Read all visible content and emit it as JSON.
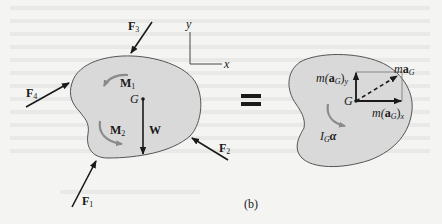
{
  "figure": {
    "caption": "(b)",
    "equals_sign": "=",
    "colors": {
      "background": "#f4f4f2",
      "body_fill": "#d9d9d9",
      "body_outline": "#555555",
      "vector": "#1a1a1a",
      "moment_arrow": "#8a8a8a"
    },
    "axes": {
      "y_label": "y",
      "x_label": "x"
    },
    "free_body_diagram": {
      "forces": [
        {
          "id": "F1",
          "label": "F",
          "sub": "1"
        },
        {
          "id": "F2",
          "label": "F",
          "sub": "2"
        },
        {
          "id": "F3",
          "label": "F",
          "sub": "3"
        },
        {
          "id": "F4",
          "label": "F",
          "sub": "4"
        }
      ],
      "moments": [
        {
          "id": "M1",
          "label": "M",
          "sub": "1"
        },
        {
          "id": "M2",
          "label": "M",
          "sub": "2"
        }
      ],
      "center_of_mass": "G",
      "weight": "W"
    },
    "kinetic_diagram": {
      "center_of_mass": "G",
      "ma_y": {
        "prefix": "m(",
        "vec": "a",
        "sub": "G",
        "suffix": ")",
        "axis": "y"
      },
      "ma_x": {
        "prefix": "m(",
        "vec": "a",
        "sub": "G",
        "suffix": ")",
        "axis": "x"
      },
      "ma_G": {
        "prefix": "m",
        "vec": "a",
        "sub": "G"
      },
      "inertia_moment": {
        "prefix": "I",
        "sub": "G",
        "vec": "α"
      }
    }
  }
}
